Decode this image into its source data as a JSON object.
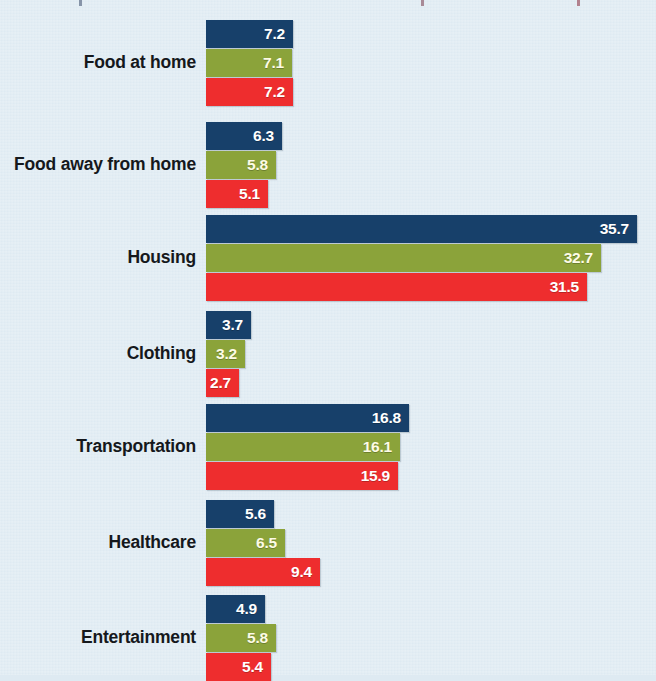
{
  "chart_data": {
    "type": "bar",
    "orientation": "horizontal",
    "title": "",
    "subtitle": "",
    "xlabel": "",
    "ylabel": "",
    "grid": false,
    "legend_position": "none",
    "xlim": [
      0,
      37
    ],
    "value_labels_shown": true,
    "categories": [
      "Food at home",
      "Food away from home",
      "Housing",
      "Clothing",
      "Transportation",
      "Healthcare",
      "Entertainment"
    ],
    "series": [
      {
        "name": "series-1",
        "color": "#17406a",
        "values": [
          7.2,
          6.3,
          35.7,
          3.7,
          16.8,
          5.6,
          4.9
        ]
      },
      {
        "name": "series-2",
        "color": "#8ba33a",
        "values": [
          7.1,
          5.8,
          32.7,
          3.2,
          16.1,
          6.5,
          5.8
        ]
      },
      {
        "name": "series-3",
        "color": "#ee2d2e",
        "values": [
          7.2,
          5.1,
          31.5,
          2.7,
          15.9,
          9.4,
          5.4
        ]
      }
    ]
  },
  "style": {
    "background_color": "#deeaf2",
    "label_color": "#15181c",
    "series_1_color": "#17406a",
    "series_2_color": "#8ba33a",
    "series_3_color": "#ee2d2e",
    "value_text_color": "#ffffff"
  },
  "layout": {
    "bar_origin_x_px": 206,
    "px_per_unit": 12.08,
    "bar_height_px": 28,
    "group_tops_px": [
      20,
      122,
      215,
      311,
      404,
      500,
      595
    ]
  }
}
